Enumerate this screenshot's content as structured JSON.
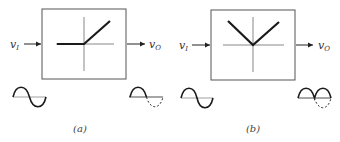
{
  "figure": {
    "panels": [
      {
        "id": "a",
        "caption": "(a)",
        "input_label": "v",
        "input_subscript": "I",
        "output_label": "v",
        "output_subscript": "O",
        "transfer": "half-wave rectifier",
        "input_waveform": "sine",
        "output_waveform": "half-wave rectified sine (negative half dashed)"
      },
      {
        "id": "b",
        "caption": "(b)",
        "input_label": "v",
        "input_subscript": "I",
        "output_label": "v",
        "output_subscript": "O",
        "transfer": "full-wave rectifier",
        "input_waveform": "sine",
        "output_waveform": "full-wave rectified sine (original negative half dashed)"
      }
    ],
    "colors": {
      "box": "#555555",
      "axis": "#888888",
      "transfer_curve": "#1a1a1a",
      "wave": "#1a1a1a",
      "baseline": "#888888"
    }
  }
}
